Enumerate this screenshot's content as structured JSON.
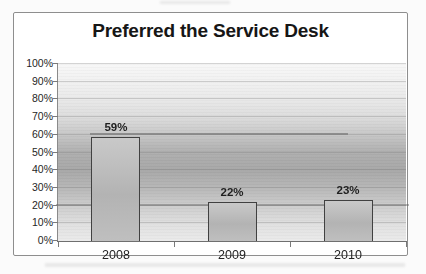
{
  "chart_data": {
    "type": "bar",
    "title": "Preferred the Service Desk",
    "categories": [
      "2008",
      "2009",
      "2010"
    ],
    "values": [
      59,
      22,
      23
    ],
    "value_labels": [
      "59%",
      "22%",
      "23%"
    ],
    "xlabel": "",
    "ylabel": "",
    "ylim": [
      0,
      100
    ],
    "ytick_interval": 10,
    "ytick_labels": [
      "0%",
      "10%",
      "20%",
      "30%",
      "40%",
      "50%",
      "60%",
      "70%",
      "80%",
      "90%",
      "100%"
    ],
    "grid": true,
    "legend": "none",
    "colors": {
      "bar_fill": "#bcbcbc",
      "bar_border": "#414141",
      "title_text": "#161616",
      "axis_text": "#262626",
      "axis_line": "#6f6f6f",
      "gridline": "#8f8f8f",
      "chart_border": "#8e8e8e",
      "page_background": "#fbfbfb",
      "plot_gradient_top_to_bottom": [
        "#f7f7f7",
        "#f1f1f1",
        "#e9e9e9",
        "#dcdcdc",
        "#c6c6c6",
        "#aeaeae",
        "#a7a7a7",
        "#b7b7b7",
        "#cccccc",
        "#dfdfdf",
        "#ebebeb"
      ]
    }
  }
}
